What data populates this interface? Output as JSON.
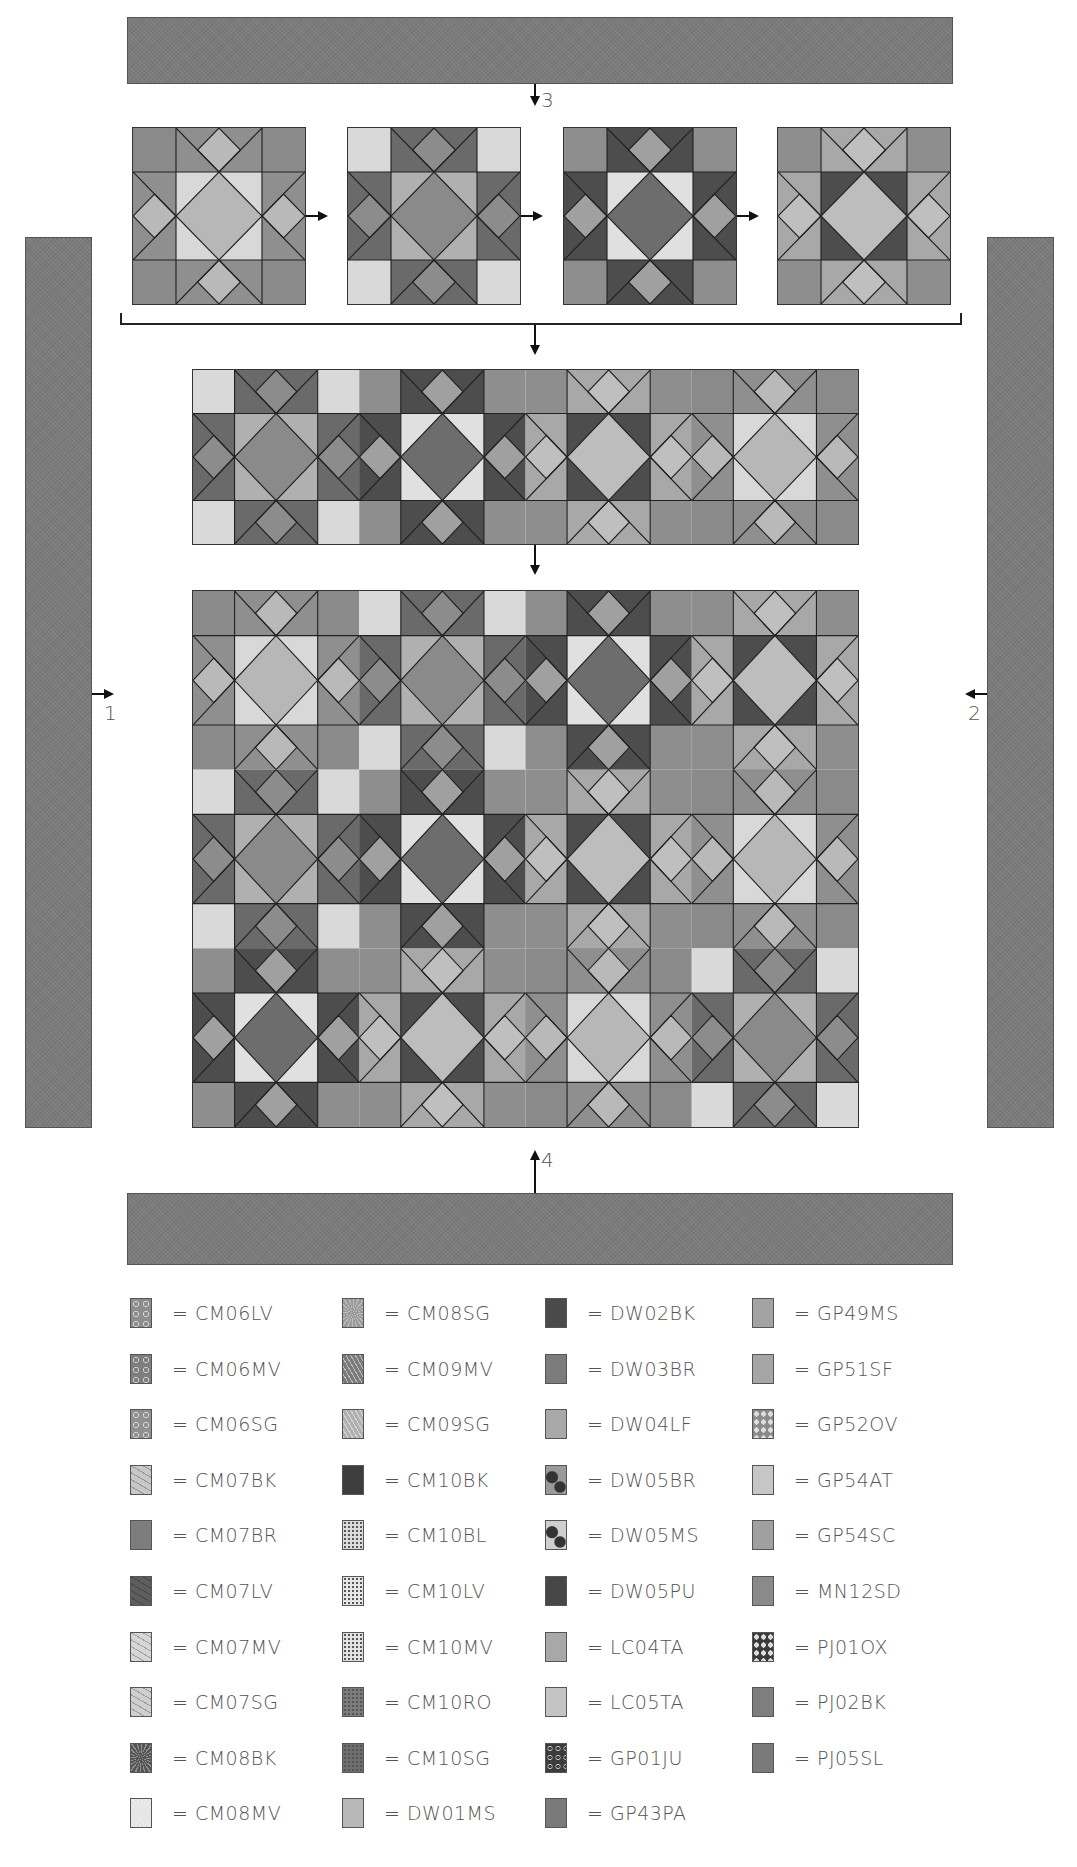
{
  "header": {
    "cut_text": "...(top text cropped)..."
  },
  "borders": {
    "top": {
      "label": "3",
      "color": "#7b7b7b"
    },
    "left": {
      "label": "1",
      "color": "#7b7b7b"
    },
    "right": {
      "label": "2",
      "color": "#7b7b7b"
    },
    "bottom": {
      "label": "4",
      "color": "#7b7b7b"
    }
  },
  "blocks": [
    {
      "name": "block-1",
      "corner": "#8a8a8a",
      "star": "#8f8f8f",
      "bg": "#d8d8d8",
      "center": "#b7b7b7",
      "small": "#b9b9b9"
    },
    {
      "name": "block-2",
      "corner": "#d9d9d9",
      "star": "#6a6a6a",
      "bg": "#b0b0b0",
      "center": "#8a8a8a",
      "small": "#8c8c8c"
    },
    {
      "name": "block-3",
      "corner": "#8e8e8e",
      "star": "#4d4d4d",
      "bg": "#e0e0e0",
      "center": "#6d6d6d",
      "small": "#a0a0a0"
    },
    {
      "name": "block-4",
      "corner": "#8e8e8e",
      "star": "#a8a8a8",
      "bg": "#4d4d4d",
      "center": "#bdbdbd",
      "small": "#bfbfbf"
    }
  ],
  "legend": {
    "items": [
      {
        "code": "= CM06LV",
        "color": "#8d8d8d",
        "pattern": "swirl"
      },
      {
        "code": "= CM06MV",
        "color": "#7e7e7e",
        "pattern": "swirl"
      },
      {
        "code": "= CM06SG",
        "color": "#909090",
        "pattern": "swirl"
      },
      {
        "code": "= CM07BK",
        "color": "#c8c8c8",
        "pattern": "vine"
      },
      {
        "code": "= CM07BR",
        "color": "#7d7d7d",
        "pattern": "solid"
      },
      {
        "code": "= CM07LV",
        "color": "#5e5e5e",
        "pattern": "vine"
      },
      {
        "code": "= CM07MV",
        "color": "#d6d6d6",
        "pattern": "vine"
      },
      {
        "code": "= CM07SG",
        "color": "#cfcfcf",
        "pattern": "vine"
      },
      {
        "code": "= CM08BK",
        "color": "#555555",
        "pattern": "burst"
      },
      {
        "code": "= CM08MV",
        "color": "#e4e4e4",
        "pattern": "burst"
      },
      {
        "code": "= CM08SG",
        "color": "#9a9a9a",
        "pattern": "burst"
      },
      {
        "code": "= CM09MV",
        "color": "#7a7a7a",
        "pattern": "chevron"
      },
      {
        "code": "= CM09SG",
        "color": "#b0b0b0",
        "pattern": "chevron"
      },
      {
        "code": "= CM10BK",
        "color": "#3e3e3e",
        "pattern": "solid"
      },
      {
        "code": "= CM10BL",
        "color": "#dcdcdc",
        "pattern": "dots"
      },
      {
        "code": "= CM10LV",
        "color": "#e6e6e6",
        "pattern": "dots"
      },
      {
        "code": "= CM10MV",
        "color": "#e2e2e2",
        "pattern": "dots"
      },
      {
        "code": "= CM10RO",
        "color": "#7c7c7c",
        "pattern": "dots"
      },
      {
        "code": "= CM10SG",
        "color": "#6e6e6e",
        "pattern": "dots"
      },
      {
        "code": "= DW01MS",
        "color": "#b8b8b8",
        "pattern": "solid"
      },
      {
        "code": "= DW02BK",
        "color": "#4a4a4a",
        "pattern": "solid"
      },
      {
        "code": "= DW03BR",
        "color": "#7c7c7c",
        "pattern": "solid"
      },
      {
        "code": "= DW04LF",
        "color": "#a9a9a9",
        "pattern": "solid"
      },
      {
        "code": "= DW05BR",
        "color": "#9a9a9a",
        "pattern": "blob"
      },
      {
        "code": "= DW05MS",
        "color": "#cfcfcf",
        "pattern": "blob"
      },
      {
        "code": "= DW05PU",
        "color": "#474747",
        "pattern": "solid"
      },
      {
        "code": "= LC04TA",
        "color": "#a8a8a8",
        "pattern": "solid"
      },
      {
        "code": "= LC05TA",
        "color": "#c4c4c4",
        "pattern": "solid"
      },
      {
        "code": "= GP01JU",
        "color": "#3c3c3c",
        "pattern": "ring"
      },
      {
        "code": "= GP43PA",
        "color": "#7a7a7a",
        "pattern": "solid"
      },
      {
        "code": "= GP49MS",
        "color": "#a3a3a3",
        "pattern": "solid"
      },
      {
        "code": "= GP51SF",
        "color": "#a6a6a6",
        "pattern": "solid"
      },
      {
        "code": "= GP52OV",
        "color": "#8a8a8a",
        "pattern": "oval"
      },
      {
        "code": "= GP54AT",
        "color": "#c6c6c6",
        "pattern": "solid"
      },
      {
        "code": "= GP54SC",
        "color": "#a0a0a0",
        "pattern": "solid"
      },
      {
        "code": "= MN12SD",
        "color": "#8a8a8a",
        "pattern": "solid"
      },
      {
        "code": "= PJ01OX",
        "color": "#3a3a3a",
        "pattern": "oval"
      },
      {
        "code": "= PJ02BK",
        "color": "#7e7e7e",
        "pattern": "solid"
      },
      {
        "code": "= PJ05SL",
        "color": "#7a7a7a",
        "pattern": "solid"
      }
    ]
  }
}
